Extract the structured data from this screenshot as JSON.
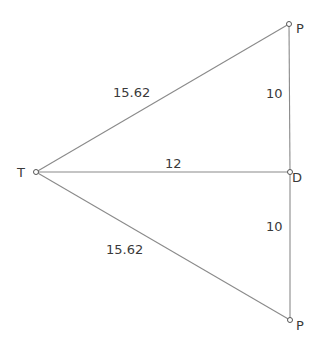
{
  "diagram": {
    "points": [
      {
        "name": "T",
        "x": 36,
        "y": 172
      },
      {
        "name": "P",
        "x": 289,
        "y": 24
      },
      {
        "name": "D",
        "x": 290,
        "y": 172
      },
      {
        "name": "P",
        "x": 290,
        "y": 320
      }
    ],
    "labels": {
      "T": "T",
      "P_top": "P",
      "D": "D",
      "P_bottom": "P"
    },
    "edges": {
      "TP_top": "15.62",
      "PD_top": "10",
      "TD": "12",
      "DP_bottom": "10",
      "TP_bottom": "15.62"
    },
    "colors": {
      "line": "#8a8a8a",
      "text": "#3a3a3a",
      "background": "#ffffff"
    }
  }
}
